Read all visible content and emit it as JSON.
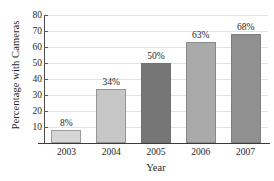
{
  "chart_data": {
    "type": "bar",
    "title": "",
    "xlabel": "Year",
    "ylabel": "Percentage with Cameras",
    "categories": [
      "2003",
      "2004",
      "2005",
      "2006",
      "2007"
    ],
    "values": [
      8,
      34,
      50,
      63,
      68
    ],
    "data_labels": [
      "8%",
      "34%",
      "50%",
      "63%",
      "68%"
    ],
    "ylim": [
      0,
      80
    ],
    "ytick_labels": [
      "10",
      "20",
      "30",
      "40",
      "50",
      "60",
      "70",
      "80"
    ],
    "ytick_values": [
      10,
      20,
      30,
      40,
      50,
      60,
      70,
      80
    ],
    "grid": "horizontal",
    "legend": "none",
    "bar_colors": [
      "#d6d6d6",
      "#c6c6c6",
      "#767676",
      "#aaaaaa",
      "#909090"
    ],
    "grid_color": "#e3e3e3",
    "axis_color": "#3a3a3a",
    "text_color": "#1f1f1f"
  }
}
